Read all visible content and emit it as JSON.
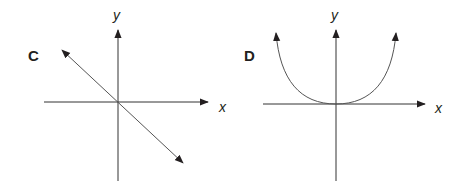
{
  "panels": [
    {
      "label": "C",
      "x_axis_label": "x",
      "y_axis_label": "y",
      "graph": "straight line through origin with negative slope, arrows both ends"
    },
    {
      "label": "D",
      "x_axis_label": "x",
      "y_axis_label": "y",
      "graph": "U-shaped curve with vertex at origin, arrows at both upper ends"
    }
  ],
  "colors": {
    "ink": "#231f20",
    "curve": "#555555"
  }
}
